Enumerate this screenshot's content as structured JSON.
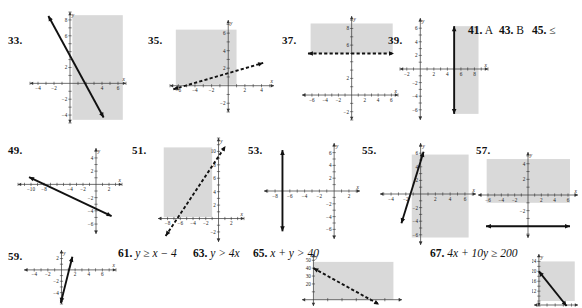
{
  "page": {
    "kind": "textbook-answer-key",
    "width": 582,
    "height": 308,
    "background": "#ffffff",
    "shade_color": "#d9d9d9",
    "line_color": "#111111",
    "axis_color": "#333333"
  },
  "exercises": [
    {
      "id": "33",
      "number": "33.",
      "type": "graph",
      "xmin": -5,
      "xmax": 7,
      "ymin": -5,
      "ymax": 9,
      "xticks": [
        -4,
        -2,
        4,
        6
      ],
      "yticks": [
        -4,
        -2,
        2,
        6,
        8
      ],
      "xlabel": "x",
      "ylabel": "y",
      "line_style": "solid",
      "line": {
        "x1": -2.7,
        "y1": 8.5,
        "x2": 4.2,
        "y2": -4.3
      },
      "shade": "right",
      "shade_rect": {
        "x1": 0.3,
        "y1": -4.6,
        "x2": 6.6,
        "y2": 8.6
      }
    },
    {
      "id": "35",
      "number": "35.",
      "type": "graph",
      "xmin": -7,
      "xmax": 5.5,
      "ymin": -3,
      "ymax": 7.5,
      "xticks": [
        -6,
        -4,
        -2,
        2,
        4
      ],
      "yticks": [
        -2,
        2,
        4,
        6
      ],
      "xlabel": "x",
      "ylabel": "y",
      "line_style": "dashed",
      "line": {
        "x1": -6.6,
        "y1": -0.4,
        "x2": 4.2,
        "y2": 2.6
      },
      "shade": "above-left",
      "shade_rect": {
        "x1": -6.3,
        "y1": 0.1,
        "x2": 1.0,
        "y2": 6.4
      }
    },
    {
      "id": "37",
      "number": "37.",
      "type": "graph",
      "xmin": -7.5,
      "xmax": 7,
      "ymin": -3,
      "ymax": 9.5,
      "xticks": [
        -6,
        -4,
        -2,
        2,
        4,
        6
      ],
      "yticks": [
        -2,
        2,
        6,
        8
      ],
      "xlabel": "x",
      "ylabel": "y",
      "line_style": "dashed",
      "line": {
        "x1": -6.6,
        "y1": 5,
        "x2": 6.4,
        "y2": 5
      },
      "shade": "above",
      "shade_rect": {
        "x1": -6.2,
        "y1": 5.0,
        "x2": 6.2,
        "y2": 8.6
      }
    },
    {
      "id": "39",
      "number": "39.",
      "type": "graph",
      "xmin": -3,
      "xmax": 10,
      "ymin": -7.5,
      "ymax": 7.5,
      "xticks": [
        -2,
        2,
        4,
        6,
        8
      ],
      "yticks": [
        -6,
        -4,
        -2,
        2,
        4,
        6
      ],
      "xlabel": "x",
      "ylabel": "y",
      "line_style": "solid",
      "line": {
        "x1": 5,
        "y1": -6.6,
        "x2": 5,
        "y2": 6.3
      },
      "shade": "right",
      "shade_rect": {
        "x1": 5.0,
        "y1": -6.6,
        "x2": 8.6,
        "y2": 6.3
      }
    },
    {
      "id": "49",
      "number": "49.",
      "type": "graph",
      "xmin": -12,
      "xmax": 4,
      "ymin": -7.5,
      "ymax": 5.5,
      "xticks": [
        -10,
        -8,
        -4,
        -2,
        2
      ],
      "yticks": [
        -6,
        -4,
        -2,
        2,
        4
      ],
      "xlabel": "x",
      "ylabel": "y",
      "line_style": "solid",
      "line": {
        "x1": -10.3,
        "y1": 1.1,
        "x2": 2.4,
        "y2": -4.8
      },
      "shade": "none"
    },
    {
      "id": "51",
      "number": "51.",
      "type": "graph",
      "xmin": -9.5,
      "xmax": 4,
      "ymin": -3.5,
      "ymax": 12,
      "xticks": [
        -8,
        -6,
        -4,
        -2,
        2
      ],
      "yticks": [
        -2,
        2,
        4,
        6,
        8,
        10
      ],
      "xlabel": "x",
      "ylabel": "y",
      "line_style": "dashed",
      "line": {
        "x1": -8.3,
        "y1": -2.6,
        "x2": 1.1,
        "y2": 10.8
      },
      "shade": "left",
      "shade_rect": {
        "x1": -8.6,
        "y1": 0.2,
        "x2": -1.0,
        "y2": 10.6
      }
    },
    {
      "id": "53",
      "number": "53.",
      "type": "graph",
      "xmin": -9.5,
      "xmax": 3.5,
      "ymin": -7.5,
      "ymax": 7.5,
      "xticks": [
        -8,
        -6,
        -4,
        -2,
        2
      ],
      "yticks": [
        -6,
        -4,
        -2,
        2,
        4,
        6
      ],
      "xlabel": "x",
      "ylabel": "y",
      "line_style": "solid",
      "line": {
        "x1": -7,
        "y1": -6.3,
        "x2": -7,
        "y2": 6.4
      },
      "shade": "none"
    },
    {
      "id": "55",
      "number": "55.",
      "type": "graph",
      "xmin": -5.5,
      "xmax": 7.5,
      "ymin": -7.5,
      "ymax": 7.5,
      "xticks": [
        -4,
        -2,
        2,
        4,
        6
      ],
      "yticks": [
        -6,
        -4,
        -2,
        2,
        4,
        6
      ],
      "xlabel": "x",
      "ylabel": "y",
      "line_style": "solid",
      "line": {
        "x1": -2.6,
        "y1": -4.3,
        "x2": 0.4,
        "y2": 6.2
      },
      "shade": "right",
      "shade_rect": {
        "x1": -1.2,
        "y1": -6.4,
        "x2": 6.5,
        "y2": 5.8
      }
    },
    {
      "id": "57",
      "number": "57.",
      "type": "graph",
      "xmin": -7.5,
      "xmax": 7.5,
      "ymin": -5.5,
      "ymax": 5.5,
      "xticks": [
        -6,
        -4,
        -2,
        2,
        4,
        6
      ],
      "yticks": [
        -2,
        2,
        4
      ],
      "xlabel": "x",
      "ylabel": "y",
      "line_style": "solid",
      "line": {
        "x1": -6.3,
        "y1": -4,
        "x2": 6.3,
        "y2": -4
      },
      "shade": "above",
      "shade_rect": {
        "x1": -6.2,
        "y1": -1.0,
        "x2": 6.3,
        "y2": 4.6
      }
    },
    {
      "id": "59",
      "number": "59.",
      "type": "graph",
      "xmin": -5.5,
      "xmax": 8,
      "ymin": -6,
      "ymax": 3.5,
      "xticks": [
        -4,
        -2,
        2,
        4,
        6
      ],
      "yticks": [
        -4,
        -2,
        2
      ],
      "xlabel": "x",
      "ylabel": "y",
      "line_style": "solid",
      "line": {
        "x1": -0.1,
        "y1": -5.8,
        "x2": 1.6,
        "y2": 2.3
      },
      "shade": "none"
    },
    {
      "id": "65g",
      "number": "",
      "type": "graph",
      "xmin": -8,
      "xmax": 62,
      "ymin": -8,
      "ymax": 58,
      "xticks": [],
      "yticks": [
        20,
        30,
        40,
        50
      ],
      "xlabel": "",
      "ylabel": "y",
      "line_style": "dashed",
      "line": {
        "x1": 0,
        "y1": 40,
        "x2": 46,
        "y2": -6
      },
      "shade": "above-right",
      "shade_rect": {
        "x1": 0,
        "y1": 0,
        "x2": 56,
        "y2": 48
      }
    },
    {
      "id": "67g",
      "number": "",
      "type": "graph",
      "xmin": -6,
      "xmax": 48,
      "ymin": 6,
      "ymax": 27,
      "xticks": [],
      "yticks": [
        12,
        16,
        20,
        24
      ],
      "xlabel": "",
      "ylabel": "y",
      "line_style": "solid",
      "line": {
        "x1": 0,
        "y1": 20,
        "x2": 34,
        "y2": 6
      },
      "shade": "above-right",
      "shade_rect": {
        "x1": 0,
        "y1": 8,
        "x2": 44,
        "y2": 24
      }
    }
  ],
  "text_answers": [
    {
      "id": "41",
      "number": "41.",
      "answer": "A"
    },
    {
      "id": "43",
      "number": "43.",
      "answer": "B"
    },
    {
      "id": "45",
      "number": "45.",
      "answer": "≤"
    },
    {
      "id": "61",
      "number": "61.",
      "answer": "y ≥ x − 4"
    },
    {
      "id": "63",
      "number": "63.",
      "answer": "y > 4x"
    },
    {
      "id": "65",
      "number": "65.",
      "answer": "x + y > 40"
    },
    {
      "id": "67",
      "number": "67.",
      "answer": "4x + 10y ≥ 200"
    }
  ]
}
